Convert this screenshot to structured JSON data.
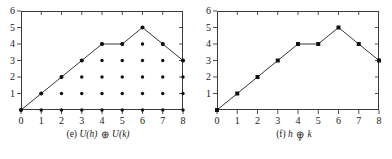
{
  "figure": {
    "background": "#ffffff",
    "line_color": "#2b2b2b",
    "axis_color": "#3a3a3a",
    "marker_color": "#111111"
  },
  "panels": [
    {
      "id": "e",
      "caption_prefix": "(e)",
      "caption_left": "U(h)",
      "caption_op": "⊕",
      "caption_op_sub": "",
      "caption_right": "U(k)",
      "caption_full": "(e) U(h) ⊕ U(k)",
      "has_dot_grid": true,
      "has_axis_dots": true,
      "marker_shape": "dot",
      "chart_data": {
        "type": "line",
        "title": "(e) U(h) ⊕ U(k)",
        "xlabel": "",
        "ylabel": "",
        "x": [
          0,
          1,
          2,
          3,
          4,
          5,
          6,
          7,
          8
        ],
        "y": [
          0,
          1,
          2,
          3,
          4,
          4,
          5,
          4,
          3
        ],
        "xticks": [
          "0",
          "1",
          "2",
          "3",
          "4",
          "5",
          "6",
          "7",
          "8"
        ],
        "yticks": [
          "",
          "1",
          "2",
          "3",
          "4",
          "5",
          "6"
        ],
        "ytick_values": [
          0,
          1,
          2,
          3,
          4,
          5,
          6
        ],
        "xlim": [
          0,
          8
        ],
        "ylim": [
          0,
          6
        ],
        "grid": false,
        "legend": "none",
        "series": [
          {
            "name": "U(h) ⊕ U(k)",
            "values": [
              0,
              1,
              2,
              3,
              4,
              4,
              5,
              4,
              3
            ]
          }
        ],
        "lattice_points": [
          {
            "x": 0,
            "ys": [
              0
            ]
          },
          {
            "x": 1,
            "ys": [
              0,
              1
            ]
          },
          {
            "x": 2,
            "ys": [
              0,
              1,
              2
            ]
          },
          {
            "x": 3,
            "ys": [
              0,
              1,
              2,
              3
            ]
          },
          {
            "x": 4,
            "ys": [
              0,
              1,
              2,
              3,
              4
            ]
          },
          {
            "x": 5,
            "ys": [
              0,
              1,
              2,
              3,
              4
            ]
          },
          {
            "x": 6,
            "ys": [
              0,
              1,
              2,
              3,
              4,
              5
            ]
          },
          {
            "x": 7,
            "ys": [
              0,
              1,
              2,
              3,
              4
            ]
          },
          {
            "x": 8,
            "ys": [
              0,
              1,
              2,
              3
            ]
          }
        ]
      }
    },
    {
      "id": "f",
      "caption_prefix": "(f)",
      "caption_left": "h",
      "caption_op": "⊕",
      "caption_op_sub": "g",
      "caption_right": "k",
      "caption_full": "(f) h ⊕g k",
      "has_dot_grid": false,
      "has_axis_dots": false,
      "marker_shape": "square",
      "chart_data": {
        "type": "line",
        "title": "(f) h ⊕g k",
        "xlabel": "",
        "ylabel": "",
        "x": [
          0,
          1,
          2,
          3,
          4,
          5,
          6,
          7,
          8
        ],
        "y": [
          0,
          1,
          2,
          3,
          4,
          4,
          5,
          4,
          3
        ],
        "xticks": [
          "0",
          "1",
          "2",
          "3",
          "4",
          "5",
          "6",
          "7",
          "8"
        ],
        "yticks": [
          "",
          "1",
          "2",
          "3",
          "4",
          "5",
          "6"
        ],
        "ytick_values": [
          0,
          1,
          2,
          3,
          4,
          5,
          6
        ],
        "xlim": [
          0,
          8
        ],
        "ylim": [
          0,
          6
        ],
        "grid": false,
        "legend": "none",
        "series": [
          {
            "name": "h ⊕g k",
            "values": [
              0,
              1,
              2,
              3,
              4,
              4,
              5,
              4,
              3
            ]
          }
        ]
      }
    }
  ]
}
